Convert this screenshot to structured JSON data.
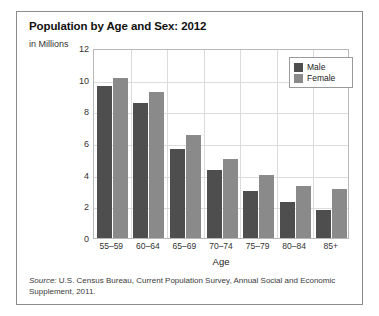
{
  "chart": {
    "title": "Population by Age and Sex: 2012",
    "y_unit_label": "in Millions",
    "x_axis_title": "Age",
    "legend": {
      "male_label": "Male",
      "female_label": "Female"
    },
    "source_label": "Source:",
    "source_text": " U.S. Census Bureau, Current Population Survey, Annual Social and Economic Supplement, 2011."
  },
  "colors": {
    "male": "#4e4e4e",
    "female": "#8a8a8a",
    "frame": "#8c8c8c",
    "grid": "#dcdcdc",
    "plot_border": "#b8b8b8",
    "text": "#333333"
  },
  "chart_data": {
    "type": "bar",
    "title": "Population by Age and Sex: 2012",
    "subtitle": "in Millions",
    "xlabel": "Age",
    "ylabel": "in Millions",
    "ylim": [
      0,
      12
    ],
    "yticks": [
      0,
      2,
      4,
      6,
      8,
      10,
      12
    ],
    "ytick_labels": [
      "0",
      "2",
      "4",
      "6",
      "8",
      "10",
      "12"
    ],
    "grid": true,
    "legend_position": "top-right",
    "categories": [
      "55–59",
      "60–64",
      "65–69",
      "70–74",
      "75–79",
      "80–84",
      "85+"
    ],
    "series": [
      {
        "name": "Male",
        "color": "#4e4e4e",
        "values": [
          9.6,
          8.5,
          5.6,
          4.3,
          3.0,
          2.3,
          1.8
        ]
      },
      {
        "name": "Female",
        "color": "#8a8a8a",
        "values": [
          10.1,
          9.2,
          6.5,
          5.0,
          4.0,
          3.3,
          3.1
        ]
      }
    ]
  }
}
